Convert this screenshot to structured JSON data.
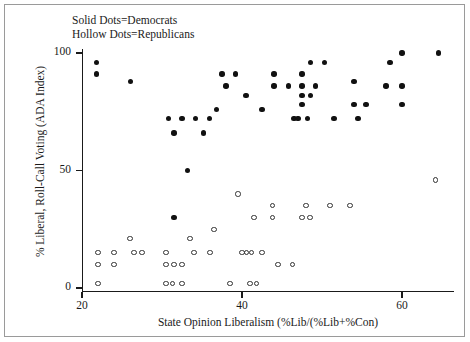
{
  "legend": {
    "line1": "Solid Dots=Democrats",
    "line2": "Hollow Dots=Republicans",
    "democrat_marker": "solid-dot",
    "republican_marker": "hollow-dot"
  },
  "axes": {
    "y_title": "% Liberal, Roll-Call Voting (ADA Index)",
    "x_title": "State Opinion Liberalism (%Lib/(%Lib+%Con)",
    "y_ticks": [
      0,
      50,
      100
    ],
    "x_ticks": [
      20,
      40,
      60
    ],
    "y_tick_labels": [
      "0",
      "50",
      "100"
    ],
    "x_tick_labels": [
      "20",
      "40",
      "60"
    ]
  },
  "colors": {
    "democrat": "#111111",
    "republican_outline": "#333333",
    "axis": "#1a1a1a",
    "frame": "#9a9a9a",
    "background": "#ffffff"
  },
  "chart_data": {
    "type": "scatter",
    "title": "",
    "xlabel": "State Opinion Liberalism (%Lib/(%Lib+%Con)",
    "ylabel": "% Liberal, Roll-Call Voting (ADA Index)",
    "xlim": [
      18,
      68
    ],
    "ylim": [
      -3,
      104
    ],
    "xticks": [
      20,
      40,
      60
    ],
    "yticks": [
      0,
      50,
      100
    ],
    "grid": false,
    "legend_position": "top-left-inside",
    "series": [
      {
        "name": "Democrats",
        "marker": "solid-dot",
        "color": "#111111",
        "points": [
          [
            21.8,
            96
          ],
          [
            21.8,
            91
          ],
          [
            26.1,
            88
          ],
          [
            30.8,
            72
          ],
          [
            32.5,
            72
          ],
          [
            34.2,
            72
          ],
          [
            35.9,
            72
          ],
          [
            31.5,
            66
          ],
          [
            35.2,
            66
          ],
          [
            31.5,
            30
          ],
          [
            33.2,
            50
          ],
          [
            37.5,
            91
          ],
          [
            39.2,
            91
          ],
          [
            38.0,
            86
          ],
          [
            40.5,
            82
          ],
          [
            36.8,
            76
          ],
          [
            44.0,
            91
          ],
          [
            44.0,
            86
          ],
          [
            45.8,
            86
          ],
          [
            42.5,
            76
          ],
          [
            46.5,
            72
          ],
          [
            47.5,
            91
          ],
          [
            48.6,
            96
          ],
          [
            50.3,
            96
          ],
          [
            47.5,
            86
          ],
          [
            49.2,
            86
          ],
          [
            47.5,
            82
          ],
          [
            48.6,
            82
          ],
          [
            47.5,
            78
          ],
          [
            47.0,
            72
          ],
          [
            48.2,
            72
          ],
          [
            51.5,
            72
          ],
          [
            54.0,
            88
          ],
          [
            54.0,
            78
          ],
          [
            55.5,
            78
          ],
          [
            54.5,
            72
          ],
          [
            58.5,
            96
          ],
          [
            58.0,
            86
          ],
          [
            60.0,
            78
          ],
          [
            60.0,
            100
          ],
          [
            64.6,
            100
          ],
          [
            60.0,
            86
          ]
        ]
      },
      {
        "name": "Republicans",
        "marker": "hollow-dot",
        "color": "#333333",
        "points": [
          [
            22.0,
            15
          ],
          [
            22.0,
            10
          ],
          [
            22.0,
            2
          ],
          [
            24.0,
            15
          ],
          [
            24.0,
            10
          ],
          [
            26.5,
            15
          ],
          [
            27.5,
            15
          ],
          [
            26.0,
            21
          ],
          [
            30.5,
            15
          ],
          [
            30.5,
            10
          ],
          [
            31.5,
            10
          ],
          [
            32.5,
            10
          ],
          [
            30.5,
            2
          ],
          [
            31.3,
            2
          ],
          [
            32.5,
            2
          ],
          [
            34.0,
            15
          ],
          [
            33.5,
            21
          ],
          [
            36.5,
            25
          ],
          [
            36.0,
            15
          ],
          [
            38.5,
            2
          ],
          [
            40.0,
            15
          ],
          [
            40.6,
            15
          ],
          [
            41.2,
            15
          ],
          [
            41.0,
            2
          ],
          [
            41.8,
            2
          ],
          [
            41.5,
            30
          ],
          [
            39.5,
            40
          ],
          [
            42.5,
            15
          ],
          [
            43.8,
            35
          ],
          [
            43.8,
            30
          ],
          [
            44.5,
            10
          ],
          [
            46.3,
            10
          ],
          [
            48.0,
            35
          ],
          [
            51.0,
            35
          ],
          [
            47.5,
            30
          ],
          [
            48.5,
            30
          ],
          [
            53.5,
            35
          ],
          [
            64.2,
            46
          ]
        ]
      }
    ]
  }
}
